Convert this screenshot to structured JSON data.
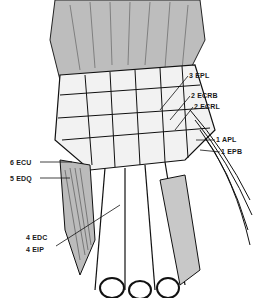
{
  "diagram": {
    "labels": [
      {
        "id": "epl",
        "text": "3 EPL",
        "x": 189,
        "y": 72
      },
      {
        "id": "ecrb",
        "text": "2 ECRB",
        "x": 191,
        "y": 92
      },
      {
        "id": "ecrl",
        "text": "2 ECRL",
        "x": 194,
        "y": 103
      },
      {
        "id": "apl",
        "text": "1 APL",
        "x": 216,
        "y": 136
      },
      {
        "id": "epb",
        "text": "1 EPB",
        "x": 221,
        "y": 148
      },
      {
        "id": "ecu",
        "text": "6 ECU",
        "x": 10,
        "y": 159
      },
      {
        "id": "edq",
        "text": "5 EDQ",
        "x": 10,
        "y": 175
      },
      {
        "id": "edc",
        "text": "4 EDC",
        "x": 26,
        "y": 234
      },
      {
        "id": "eip",
        "text": "4 EIP",
        "x": 26,
        "y": 246
      }
    ]
  }
}
